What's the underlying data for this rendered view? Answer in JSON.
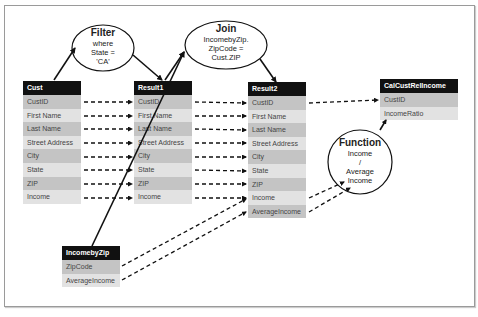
{
  "tables": {
    "cust": {
      "title": "Cust",
      "rows": [
        "CustID",
        "First Name",
        "Last Name",
        "Street Address",
        "City",
        "State",
        "ZIP",
        "Income"
      ]
    },
    "result1": {
      "title": "Result1",
      "rows": [
        "CustID",
        "First Name",
        "Last Name",
        "Street Address",
        "City",
        "State",
        "ZIP",
        "Income"
      ]
    },
    "result2": {
      "title": "Result2",
      "rows": [
        "CustID",
        "First Name",
        "Last Name",
        "Street Address",
        "City",
        "State",
        "ZIP",
        "Income",
        "AverageIncome"
      ]
    },
    "calc": {
      "title": "CalCustRelIncome",
      "rows": [
        "CustID",
        "IncomeRatio"
      ]
    },
    "incomebyzip": {
      "title": "IncomebyZip",
      "rows": [
        "ZipCode",
        "AverageIncome"
      ]
    }
  },
  "operations": {
    "filter": {
      "title": "Filter",
      "lines": [
        "where",
        "State =",
        "'CA'"
      ]
    },
    "join": {
      "title": "Join",
      "lines": [
        "IncomebyZip.",
        "ZipCode =",
        "Cust.ZIP"
      ]
    },
    "function": {
      "title": "Function",
      "lines": [
        "Income",
        "/",
        "Average",
        "Income"
      ]
    }
  },
  "colors": {
    "header": "#111111",
    "row_dark": "#c4c4c4",
    "row_light": "#e2e2e2",
    "line": "#111111"
  }
}
